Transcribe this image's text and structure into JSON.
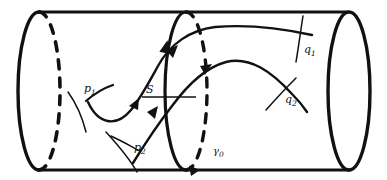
{
  "figure": {
    "background_color": "#ffffff",
    "stroke_color": "#111111",
    "labels": {
      "p1": {
        "base": "p",
        "sub": "1",
        "x": 84,
        "y": 92
      },
      "p2": {
        "base": "p",
        "sub": "2",
        "x": 134,
        "y": 151
      },
      "q1": {
        "base": "q",
        "sub": "1",
        "x": 304,
        "y": 53
      },
      "q2": {
        "base": "q",
        "sub": "2",
        "x": 285,
        "y": 103
      },
      "gamma0": {
        "base": "γ",
        "sub": "0",
        "x": 213,
        "y": 154
      },
      "S": {
        "base": "S",
        "sub": "",
        "x": 146,
        "y": 93
      }
    },
    "geometry": {
      "cylinder": {
        "top_edge": {
          "x1": 39,
          "y1": 12,
          "x2": 348,
          "y2": 12
        },
        "bottom_edge": {
          "x1": 38,
          "y1": 170,
          "x2": 350,
          "y2": 170
        },
        "left_cap": {
          "cx": 39,
          "cy": 91,
          "rx": 21,
          "ry": 79,
          "front_solid": true,
          "back_dashed": true
        },
        "right_cap": {
          "cx": 349,
          "cy": 91,
          "rx": 21,
          "ry": 79,
          "full_solid": true
        },
        "middle_orbit": {
          "cx": 186,
          "cy": 91,
          "rx": 21,
          "ry": 79,
          "front_solid": true,
          "back_dashed": true
        }
      },
      "section_S": {
        "x1": 142,
        "y1": 97,
        "x2": 196,
        "y2": 97
      }
    },
    "arrows": [
      {
        "name": "orbit-arrow-top",
        "x": 168,
        "y": 46,
        "angle": -80
      },
      {
        "name": "orbit-arrow-bottom",
        "x": 196,
        "y": 168,
        "angle": 160
      },
      {
        "name": "flow1-arrow-start",
        "x": 137,
        "y": 101,
        "angle": -55
      },
      {
        "name": "flow1-arrow-mid",
        "x": 190,
        "y": 52,
        "angle": -50
      },
      {
        "name": "flow2-arrow-start",
        "x": 155,
        "y": 111,
        "angle": -62
      },
      {
        "name": "flow2-arrow-mid",
        "x": 205,
        "y": 73,
        "angle": -32
      }
    ],
    "crosses": [
      {
        "name": "p1",
        "cx": 81,
        "cy": 100
      },
      {
        "name": "p2",
        "cx": 126,
        "cy": 146
      },
      {
        "name": "q1",
        "cx": 299,
        "cy": 43
      },
      {
        "name": "q2",
        "cx": 281,
        "cy": 94
      }
    ]
  }
}
